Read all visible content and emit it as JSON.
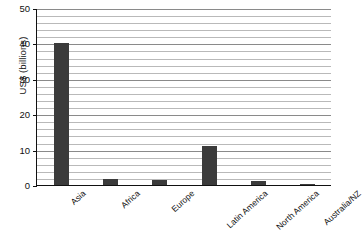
{
  "chart_data": {
    "type": "bar",
    "title": "",
    "xlabel": "",
    "ylabel": "US$ (billions)",
    "categories": [
      "Asia",
      "Africa",
      "Europe",
      "Latin America",
      "North America",
      "Australia/NZ"
    ],
    "values": [
      40.5,
      2.0,
      1.8,
      11.3,
      1.5,
      0.7
    ],
    "ylim": [
      0,
      50
    ],
    "ytick_labels": [
      "0",
      "10",
      "20",
      "30",
      "40",
      "50"
    ],
    "ytick_values": [
      0,
      10,
      20,
      30,
      40,
      50
    ],
    "grid": "horizontal",
    "grid_interval": 2,
    "legend": "none",
    "bar_color": "#3b3b3b",
    "gridline_color": "#b9b9b9",
    "axis_color": "#111111",
    "background_color": "#ffffff"
  }
}
